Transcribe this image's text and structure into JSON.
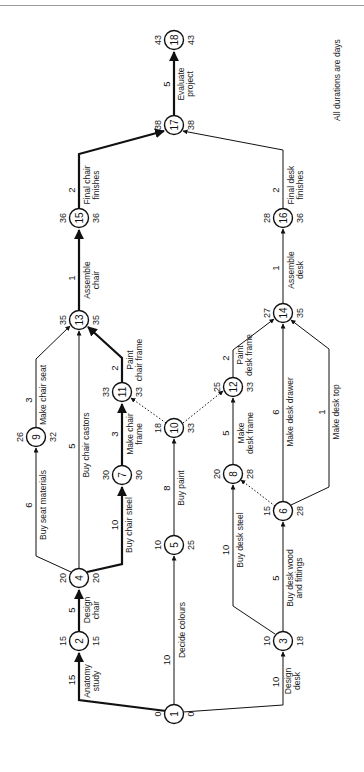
{
  "note": "All durations are days",
  "nodes": [
    {
      "id": "1",
      "x": 174,
      "y": 714,
      "early": "0",
      "late": "0"
    },
    {
      "id": "2",
      "x": 79,
      "y": 641,
      "early": "15",
      "late": "15"
    },
    {
      "id": "3",
      "x": 283,
      "y": 641,
      "early": "10",
      "late": "18"
    },
    {
      "id": "4",
      "x": 79,
      "y": 578,
      "early": "20",
      "late": "20"
    },
    {
      "id": "5",
      "x": 174,
      "y": 545,
      "early": "10",
      "late": "25"
    },
    {
      "id": "6",
      "x": 283,
      "y": 511,
      "early": "15",
      "late": "28"
    },
    {
      "id": "7",
      "x": 122,
      "y": 475,
      "early": "30",
      "late": "30"
    },
    {
      "id": "8",
      "x": 233,
      "y": 474,
      "early": "20",
      "late": "28"
    },
    {
      "id": "9",
      "x": 36,
      "y": 437,
      "early": "26",
      "late": "32"
    },
    {
      "id": "10",
      "x": 174,
      "y": 428,
      "early": "18",
      "late": "33"
    },
    {
      "id": "11",
      "x": 122,
      "y": 392,
      "early": "33",
      "late": "33"
    },
    {
      "id": "12",
      "x": 233,
      "y": 387,
      "early": "25",
      "late": "33"
    },
    {
      "id": "13",
      "x": 79,
      "y": 320,
      "early": "35",
      "late": "35"
    },
    {
      "id": "14",
      "x": 283,
      "y": 313,
      "early": "27",
      "late": "35"
    },
    {
      "id": "15",
      "x": 79,
      "y": 218,
      "early": "36",
      "late": "36"
    },
    {
      "id": "16",
      "x": 283,
      "y": 218,
      "early": "28",
      "late": "36"
    },
    {
      "id": "17",
      "x": 174,
      "y": 125,
      "early": "38",
      "late": "38"
    },
    {
      "id": "18",
      "x": 174,
      "y": 40,
      "early": "43",
      "late": "43"
    }
  ],
  "activities": [
    {
      "from": "1",
      "to": "2",
      "label": "Anatomy study",
      "duration": "15",
      "critical": true
    },
    {
      "from": "1",
      "to": "5",
      "label": "Decide colours",
      "duration": "10",
      "critical": false
    },
    {
      "from": "1",
      "to": "3",
      "label": "Design desk",
      "duration": "10",
      "critical": false
    },
    {
      "from": "2",
      "to": "4",
      "label": "Design chair",
      "duration": "5",
      "critical": true
    },
    {
      "from": "4",
      "to": "9",
      "label": "Buy seat materials",
      "duration": "6",
      "critical": false
    },
    {
      "from": "4",
      "to": "13",
      "label": "Buy chair castors",
      "duration": "5",
      "critical": false
    },
    {
      "from": "4",
      "to": "7",
      "label": "Buy chair steel",
      "duration": "10",
      "critical": true
    },
    {
      "from": "5",
      "to": "10",
      "label": "Buy paint",
      "duration": "8",
      "critical": false
    },
    {
      "from": "3",
      "to": "8",
      "label": "Buy desk steel",
      "duration": "10",
      "critical": false
    },
    {
      "from": "3",
      "to": "6",
      "label": "Buy desk wood and fittings",
      "duration": "5",
      "critical": false
    },
    {
      "from": "7",
      "to": "11",
      "label": "Make chair frame",
      "duration": "3",
      "critical": true
    },
    {
      "from": "9",
      "to": "13",
      "label": "Make chair seat",
      "duration": "3",
      "critical": false
    },
    {
      "from": "11",
      "to": "13",
      "label": "Paint chair frame",
      "duration": "2",
      "critical": true
    },
    {
      "from": "8",
      "to": "12",
      "label": "Make desk frame",
      "duration": "5",
      "critical": false
    },
    {
      "from": "12",
      "to": "14",
      "label": "Paint desk frame",
      "duration": "2",
      "critical": false
    },
    {
      "from": "6",
      "to": "14",
      "label": "Make desk drawer",
      "duration": "6",
      "critical": false
    },
    {
      "from": "6",
      "to": "14",
      "label": "Make desk top",
      "duration": "1",
      "critical": false
    },
    {
      "from": "13",
      "to": "15",
      "label": "Assemble chair",
      "duration": "1",
      "critical": true
    },
    {
      "from": "14",
      "to": "16",
      "label": "Assemble desk",
      "duration": "1",
      "critical": false
    },
    {
      "from": "15",
      "to": "17",
      "label": "Final chair finishes",
      "duration": "2",
      "critical": true
    },
    {
      "from": "16",
      "to": "17",
      "label": "Final desk finishes",
      "duration": "2",
      "critical": false
    },
    {
      "from": "17",
      "to": "18",
      "label": "Evaluate project",
      "duration": "5",
      "critical": true
    }
  ],
  "dummies": [
    {
      "from": "10",
      "to": "11"
    },
    {
      "from": "10",
      "to": "12"
    },
    {
      "from": "6",
      "to": "8"
    }
  ]
}
